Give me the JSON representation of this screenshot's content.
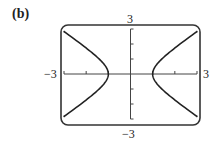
{
  "panel": {
    "label": "(b)"
  },
  "chart_data": {
    "type": "line",
    "title": "",
    "xlabel": "",
    "ylabel": "",
    "xlim": [
      -3,
      3
    ],
    "ylim": [
      -3,
      3
    ],
    "grid": false,
    "axis_labels": {
      "x_min": "−3",
      "x_max": "3",
      "y_min": "−3",
      "y_max": "3"
    },
    "x_ticks": [
      -3,
      -2,
      -1,
      0,
      1,
      2,
      3
    ],
    "y_ticks": [
      -3,
      -2,
      -1,
      0,
      1,
      2,
      3
    ],
    "equation": "x^2 - y^2 = 1",
    "series": [
      {
        "name": "right branch",
        "points": [
          [
            3,
            -2.83
          ],
          [
            2,
            -1.73
          ],
          [
            1.5,
            -1.12
          ],
          [
            1,
            0
          ],
          [
            1.5,
            1.12
          ],
          [
            2,
            1.73
          ],
          [
            3,
            2.83
          ]
        ]
      },
      {
        "name": "left branch",
        "points": [
          [
            -3,
            -2.83
          ],
          [
            -2,
            -1.73
          ],
          [
            -1.5,
            -1.12
          ],
          [
            -1,
            0
          ],
          [
            -1.5,
            1.12
          ],
          [
            -2,
            1.73
          ],
          [
            -3,
            2.83
          ]
        ]
      }
    ],
    "colors": {
      "curve": "#222222",
      "frame": "#333333",
      "axes": "#444444"
    }
  }
}
